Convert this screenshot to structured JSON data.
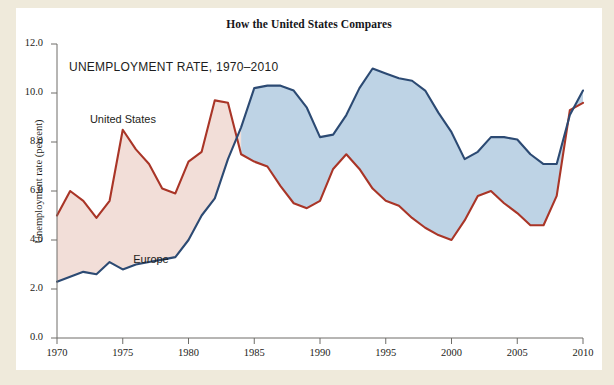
{
  "figure": {
    "title": "How the United States Compares",
    "subtitle": "UNEMPLOYMENT RATE, 1970–2010",
    "background_color": "#efeadb",
    "panel_color": "#ffffff"
  },
  "labels": {
    "united_states": "United States",
    "europe": "Europe"
  },
  "chart_data": {
    "type": "line",
    "title": "How the United States Compares",
    "subtitle": "UNEMPLOYMENT RATE, 1970–2010",
    "xlabel": "",
    "ylabel": "Unemployment rate (percent)",
    "xlim": [
      1970,
      2010
    ],
    "ylim": [
      0.0,
      12.0
    ],
    "xticks": [
      1970,
      1975,
      1980,
      1985,
      1990,
      1995,
      2000,
      2005,
      2010
    ],
    "xtick_labels": [
      "1970",
      "1975",
      "1980",
      "1985",
      "1990",
      "1995",
      "2000",
      "2005",
      "2010"
    ],
    "yticks": [
      0.0,
      2.0,
      4.0,
      6.0,
      8.0,
      10.0,
      12.0
    ],
    "ytick_labels": [
      "0.0",
      "2.0",
      "4.0",
      "6.0",
      "8.0",
      "10.0",
      "12.0"
    ],
    "grid": false,
    "legend": "inline-annotations",
    "fill_between": true,
    "fill_colors": {
      "us_above_europe": "#f2ded8",
      "europe_above_us": "#bed3e5"
    },
    "x": [
      1970,
      1971,
      1972,
      1973,
      1974,
      1975,
      1976,
      1977,
      1978,
      1979,
      1980,
      1981,
      1982,
      1983,
      1984,
      1985,
      1986,
      1987,
      1988,
      1989,
      1990,
      1991,
      1992,
      1993,
      1994,
      1995,
      1996,
      1997,
      1998,
      1999,
      2000,
      2001,
      2002,
      2003,
      2004,
      2005,
      2006,
      2007,
      2008,
      2009,
      2010
    ],
    "series": [
      {
        "name": "United States",
        "color": "#a93527",
        "values": [
          5.0,
          6.0,
          5.6,
          4.9,
          5.6,
          8.5,
          7.7,
          7.1,
          6.1,
          5.9,
          7.2,
          7.6,
          9.7,
          9.6,
          7.5,
          7.2,
          7.0,
          6.2,
          5.5,
          5.3,
          5.6,
          6.9,
          7.5,
          6.9,
          6.1,
          5.6,
          5.4,
          4.9,
          4.5,
          4.2,
          4.0,
          4.8,
          5.8,
          6.0,
          5.5,
          5.1,
          4.6,
          4.6,
          5.8,
          9.3,
          9.6
        ]
      },
      {
        "name": "Europe",
        "color": "#2c4a73",
        "values": [
          2.3,
          2.5,
          2.7,
          2.6,
          3.1,
          2.8,
          3.0,
          3.1,
          3.2,
          3.3,
          4.0,
          5.0,
          5.7,
          7.3,
          8.6,
          10.2,
          10.3,
          10.3,
          10.1,
          9.4,
          8.2,
          8.3,
          9.1,
          10.2,
          11.0,
          10.8,
          10.6,
          10.5,
          10.1,
          9.2,
          8.4,
          7.3,
          7.6,
          8.2,
          8.2,
          8.1,
          7.5,
          7.1,
          7.1,
          9.1,
          10.1
        ]
      }
    ],
    "annotations": [
      {
        "text": "United States",
        "x": 1972.5,
        "y": 8.9
      },
      {
        "text": "Europe",
        "x": 1975.8,
        "y": 3.2
      }
    ]
  }
}
